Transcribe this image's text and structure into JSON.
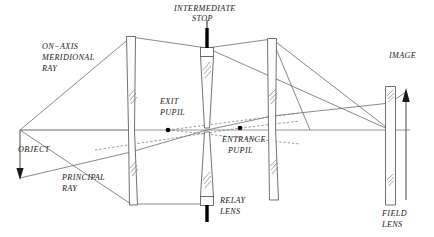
{
  "diagram": {
    "type": "optical-ray-diagram",
    "canvas": {
      "width": 434,
      "height": 237
    },
    "colors": {
      "background": "#ffffff",
      "line": "#4a4a4a",
      "ray": "#6b6b6b",
      "stop_fill": "#000000",
      "text": "#1a1a1a",
      "pupil_dot": "#000000"
    },
    "optical_axis": {
      "y": 130,
      "x_start": 20,
      "x_end": 410
    },
    "labels": {
      "on_axis_meridional_ray": "ON−AXIS\nMERIDIONAL\nRAY",
      "on_axis_meridional_ray_lines": [
        "ON−AXIS",
        "MERIDIONAL",
        "RAY"
      ],
      "intermediate_stop": "INTERMEDIATE\nSTOP",
      "intermediate_stop_lines": [
        "INTERMEDIATE",
        "STOP"
      ],
      "image": "IMAGE",
      "exit_pupil": "EXIT\nPUPIL",
      "exit_pupil_lines": [
        "EXIT",
        "PUPIL"
      ],
      "entrance_pupil": "ENTRANCE\nPUPIL",
      "entrance_pupil_lines": [
        "ENTRANCE",
        "PUPIL"
      ],
      "object": "OBJECT",
      "principal_ray": "PRINCIPAL\nRAY",
      "principal_ray_lines": [
        "PRINCIPAL",
        "RAY"
      ],
      "relay_lens": "RELAY\nLENS",
      "relay_lens_lines": [
        "RELAY",
        "LENS"
      ],
      "field_lens": "FIELD\nLENS",
      "field_lens_lines": [
        "FIELD",
        "LENS"
      ]
    },
    "elements": [
      {
        "name": "object-arrow",
        "kind": "object",
        "x": 20,
        "y_top": 130,
        "y_bottom": 178,
        "direction": "down"
      },
      {
        "name": "lens-1",
        "kind": "lens",
        "x": 131,
        "y_top": 36,
        "y_bottom": 205
      },
      {
        "name": "relay-lens",
        "kind": "lens",
        "x": 207,
        "y_top": 47,
        "y_bottom": 205
      },
      {
        "name": "lens-3",
        "kind": "lens",
        "x": 272,
        "y_top": 38,
        "y_bottom": 200
      },
      {
        "name": "field-lens",
        "kind": "lens",
        "x": 390,
        "y_top": 86,
        "y_bottom": 205
      },
      {
        "name": "image-arrow",
        "kind": "image",
        "x": 406,
        "y_top": 88,
        "y_bottom": 200,
        "direction": "up"
      }
    ],
    "pupils": [
      {
        "name": "exit-pupil",
        "x": 168,
        "y": 130
      },
      {
        "name": "entrance-pupil",
        "x": 240,
        "y": 128
      }
    ],
    "stops": [
      {
        "name": "intermediate-stop-upper",
        "x": 207,
        "y_top": 28,
        "y_bottom": 47
      },
      {
        "name": "intermediate-stop-lower",
        "x": 207,
        "y_top": 205,
        "y_bottom": 222
      }
    ]
  }
}
